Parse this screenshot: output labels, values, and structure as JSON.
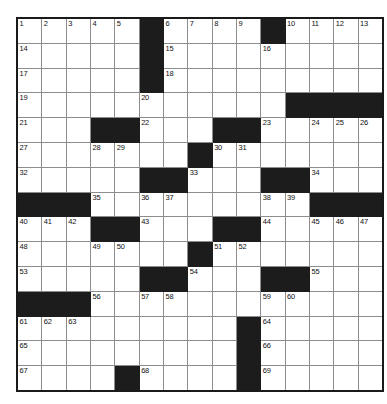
{
  "puzzle": {
    "title": "Crossword Grid",
    "type": "crossword",
    "rows": 15,
    "cols": 15,
    "colors": {
      "block": "#1c1c1c",
      "cell": "#ffffff",
      "cell_border": "#8d8d8d",
      "outer_border": "#1a1a1a",
      "number_text": "#111111"
    },
    "cell_size_px": 23.5,
    "max_clue_number": 69,
    "grid": [
      [
        {
          "num": "1"
        },
        {
          "num": "2"
        },
        {
          "num": "3"
        },
        {
          "num": "4"
        },
        {
          "num": "5"
        },
        {
          "block": true
        },
        {
          "num": "6"
        },
        {
          "num": "7"
        },
        {
          "num": "8"
        },
        {
          "num": "9"
        },
        {
          "block": true
        },
        {
          "num": "10"
        },
        {
          "num": "11"
        },
        {
          "num": "12"
        },
        {
          "num": "13"
        }
      ],
      [
        {
          "num": "14"
        },
        {},
        {},
        {},
        {},
        {
          "block": true
        },
        {
          "num": "15"
        },
        {},
        {},
        {},
        {
          "num": "16"
        },
        {},
        {},
        {},
        {}
      ],
      [
        {
          "num": "17"
        },
        {},
        {},
        {},
        {},
        {
          "block": true
        },
        {
          "num": "18"
        },
        {},
        {},
        {},
        {},
        {},
        {},
        {},
        {}
      ],
      [
        {
          "num": "19"
        },
        {},
        {},
        {},
        {},
        {
          "num": "20"
        },
        {},
        {},
        {},
        {},
        {},
        {
          "block": true
        },
        {
          "block": true
        },
        {
          "block": true
        },
        {
          "block": true
        }
      ],
      [
        {
          "num": "21"
        },
        {},
        {},
        {
          "block": true
        },
        {
          "block": true
        },
        {
          "num": "22"
        },
        {},
        {},
        {
          "block": true
        },
        {
          "block": true
        },
        {
          "num": "23"
        },
        {},
        {
          "num": "24"
        },
        {
          "num": "25"
        },
        {
          "num": "26"
        }
      ],
      [
        {
          "num": "27"
        },
        {},
        {},
        {
          "num": "28"
        },
        {
          "num": "29"
        },
        {},
        {},
        {
          "block": true
        },
        {
          "num": "30"
        },
        {
          "num": "31"
        },
        {},
        {},
        {},
        {},
        {}
      ],
      [
        {
          "num": "32"
        },
        {},
        {},
        {},
        {},
        {
          "block": true
        },
        {
          "block": true
        },
        {
          "num": "33"
        },
        {},
        {},
        {
          "block": true
        },
        {
          "block": true
        },
        {
          "num": "34"
        },
        {},
        {}
      ],
      [
        {
          "block": true
        },
        {
          "block": true
        },
        {
          "block": true
        },
        {
          "num": "35"
        },
        {},
        {
          "num": "36"
        },
        {
          "num": "37"
        },
        {},
        {},
        {},
        {
          "num": "38"
        },
        {
          "num": "39"
        },
        {
          "block": true
        },
        {
          "block": true
        },
        {
          "block": true
        }
      ],
      [
        {
          "num": "40"
        },
        {
          "num": "41"
        },
        {
          "num": "42"
        },
        {
          "block": true
        },
        {
          "block": true
        },
        {
          "num": "43"
        },
        {},
        {},
        {
          "block": true
        },
        {
          "block": true
        },
        {
          "num": "44"
        },
        {},
        {
          "num": "45"
        },
        {
          "num": "46"
        },
        {
          "num": "47"
        }
      ],
      [
        {
          "num": "48"
        },
        {},
        {},
        {
          "num": "49"
        },
        {
          "num": "50"
        },
        {},
        {},
        {
          "block": true
        },
        {
          "num": "51"
        },
        {
          "num": "52"
        },
        {},
        {},
        {},
        {},
        {}
      ],
      [
        {
          "num": "53"
        },
        {},
        {},
        {},
        {},
        {
          "block": true
        },
        {
          "block": true
        },
        {
          "num": "54"
        },
        {},
        {},
        {
          "block": true
        },
        {
          "block": true
        },
        {
          "num": "55"
        },
        {},
        {}
      ],
      [
        {
          "block": true
        },
        {
          "block": true
        },
        {
          "block": true
        },
        {
          "num": "56"
        },
        {},
        {
          "num": "57"
        },
        {
          "num": "58"
        },
        {},
        {},
        {},
        {
          "num": "59"
        },
        {
          "num": "60"
        },
        {},
        {},
        {}
      ],
      [
        {
          "num": "61"
        },
        {
          "num": "62"
        },
        {
          "num": "63"
        },
        {},
        {},
        {},
        {},
        {},
        {},
        {
          "block": true
        },
        {
          "num": "64"
        },
        {},
        {},
        {},
        {}
      ],
      [
        {
          "num": "65"
        },
        {},
        {},
        {},
        {},
        {},
        {},
        {},
        {},
        {
          "block": true
        },
        {
          "num": "66"
        },
        {},
        {},
        {},
        {}
      ],
      [
        {
          "num": "67"
        },
        {},
        {},
        {},
        {
          "block": true
        },
        {
          "num": "68"
        },
        {},
        {},
        {},
        {
          "block": true
        },
        {
          "num": "69"
        },
        {},
        {},
        {},
        {}
      ]
    ]
  }
}
